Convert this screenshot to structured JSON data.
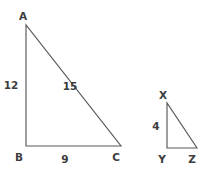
{
  "figure": {
    "canvas": {
      "width": 211,
      "height": 171,
      "background": "#ffffff"
    },
    "style": {
      "stroke_color": "#58595b",
      "stroke_width": 1.15,
      "text_color": "#3c3c3e",
      "font_size_px": 10.5
    },
    "shapes": [
      {
        "id": "triangle-abc",
        "name": "large-triangle",
        "kind": "right-triangle",
        "points": "26,25 26,146 121,146",
        "vertices": [
          {
            "key": "A",
            "label": "A",
            "x": 26,
            "y": 25,
            "label_x": 23,
            "label_y": 20
          },
          {
            "key": "B",
            "label": "B",
            "x": 26,
            "y": 146,
            "label_x": 19,
            "label_y": 161
          },
          {
            "key": "C",
            "label": "C",
            "x": 121,
            "y": 146,
            "label_x": 116,
            "label_y": 161
          }
        ],
        "sides": [
          {
            "key": "AB",
            "label": "12",
            "label_x": 11,
            "label_y": 89
          },
          {
            "key": "AC",
            "label": "15",
            "label_x": 70,
            "label_y": 90
          },
          {
            "key": "BC",
            "label": "9",
            "label_x": 65,
            "label_y": 163
          }
        ]
      },
      {
        "id": "triangle-xyz",
        "name": "small-triangle",
        "kind": "right-triangle",
        "points": "167,103 167,148 197,148",
        "vertices": [
          {
            "key": "X",
            "label": "X",
            "x": 167,
            "y": 103,
            "label_x": 163,
            "label_y": 99
          },
          {
            "key": "Y",
            "label": "Y",
            "x": 167,
            "y": 148,
            "label_x": 162,
            "label_y": 163
          },
          {
            "key": "Z",
            "label": "Z",
            "x": 197,
            "y": 148,
            "label_x": 192,
            "label_y": 163
          }
        ],
        "sides": [
          {
            "key": "XY",
            "label": "4",
            "label_x": 156,
            "label_y": 130
          }
        ]
      }
    ]
  }
}
